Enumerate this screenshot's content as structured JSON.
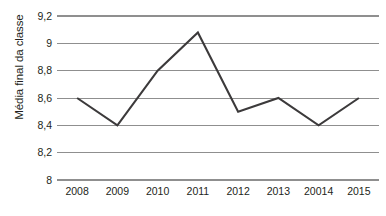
{
  "chart_data": {
    "type": "line",
    "title": "",
    "xlabel": "",
    "ylabel": "Média final da classe",
    "categories": [
      "2008",
      "2009",
      "2010",
      "2011",
      "2012",
      "2013",
      "20014",
      "2015"
    ],
    "values": [
      8.6,
      8.4,
      8.8,
      9.08,
      8.5,
      8.6,
      8.4,
      8.6
    ],
    "series": [
      {
        "name": "Média final da classe",
        "values": [
          8.6,
          8.4,
          8.8,
          9.08,
          8.5,
          8.6,
          8.4,
          8.6
        ]
      }
    ],
    "ylim": [
      8,
      9.2
    ],
    "ytick_values": [
      9.2,
      9.0,
      8.8,
      8.6,
      8.4,
      8.2,
      8.0
    ],
    "ytick_labels": [
      "9,2",
      "9",
      "8,8",
      "8,6",
      "8,4",
      "8,2",
      "8"
    ],
    "grid": true,
    "grid_axis": "y",
    "legend": false,
    "legend_position": "none",
    "decimal_separator": ",",
    "line_color": "#3c3a3b",
    "grid_color": "#8f8f8f",
    "background_color": "#ffffff",
    "text_color": "#231f20"
  }
}
